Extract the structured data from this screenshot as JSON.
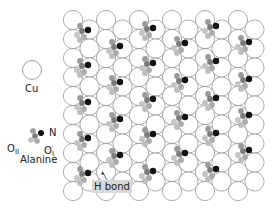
{
  "legend": {
    "cu_label": "Cu",
    "n_label": "N",
    "o2_label": "O",
    "o2_sub": "II",
    "o1_label": "O",
    "o1_sub": "I",
    "molecule_label": "Alanine"
  },
  "annotation": {
    "hbond_label": "H bond"
  },
  "colors": {
    "background": "#ffffff",
    "cu_stroke": "#888888",
    "nitrogen": "#111111",
    "carbon": "#8a8a8a",
    "oxygen": "#bdbdbd"
  },
  "lattice": {
    "columns": 12,
    "rows": 10,
    "origin_x": 73,
    "origin_y": 20,
    "col_spacing": 16.5,
    "row_spacing": 19,
    "radius": 9.6
  },
  "molecules_n_positions": [
    [
      88,
      30
    ],
    [
      88,
      65
    ],
    [
      88,
      102
    ],
    [
      88,
      138
    ],
    [
      88,
      173
    ],
    [
      120,
      46
    ],
    [
      120,
      82
    ],
    [
      120,
      119
    ],
    [
      120,
      155
    ],
    [
      153,
      28
    ],
    [
      153,
      63
    ],
    [
      153,
      99
    ],
    [
      153,
      134
    ],
    [
      153,
      171
    ],
    [
      185,
      43
    ],
    [
      185,
      80
    ],
    [
      185,
      117
    ],
    [
      185,
      153
    ],
    [
      216,
      26
    ],
    [
      216,
      61
    ],
    [
      216,
      98
    ],
    [
      216,
      133
    ],
    [
      216,
      169
    ],
    [
      249,
      42
    ],
    [
      249,
      79
    ],
    [
      249,
      115
    ],
    [
      249,
      150
    ]
  ]
}
